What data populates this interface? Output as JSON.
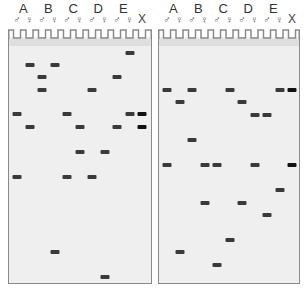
{
  "lanes": [
    {
      "group": "A",
      "sex": "♂"
    },
    {
      "group": "A",
      "sex": "♀"
    },
    {
      "group": "B",
      "sex": "♂"
    },
    {
      "group": "B",
      "sex": "♀"
    },
    {
      "group": "C",
      "sex": "♂"
    },
    {
      "group": "C",
      "sex": "♀"
    },
    {
      "group": "D",
      "sex": "♂"
    },
    {
      "group": "D",
      "sex": "♀"
    },
    {
      "group": "E",
      "sex": "♂"
    },
    {
      "group": "E",
      "sex": "♀"
    },
    {
      "group": "",
      "sex": "X"
    }
  ],
  "group_labels": [
    "A",
    "B",
    "C",
    "D",
    "E"
  ],
  "gels": [
    {
      "name": "left-gel",
      "left": 8,
      "width": 144,
      "lane_start": 17,
      "lane_spacing": 12.5,
      "bands": [
        {
          "y": 53,
          "lanes": [
            9
          ]
        },
        {
          "y": 65,
          "lanes": [
            1,
            3
          ]
        },
        {
          "y": 77,
          "lanes": [
            2,
            8
          ]
        },
        {
          "y": 90,
          "lanes": [
            2,
            6
          ]
        },
        {
          "y": 114,
          "lanes": [
            0,
            4,
            9,
            10
          ]
        },
        {
          "y": 127,
          "lanes": [
            1,
            5,
            8,
            10
          ]
        },
        {
          "y": 152,
          "lanes": [
            5,
            7
          ]
        },
        {
          "y": 177,
          "lanes": [
            0,
            4,
            6
          ]
        },
        {
          "y": 252,
          "lanes": [
            3
          ]
        },
        {
          "y": 277,
          "lanes": [
            7
          ]
        }
      ]
    },
    {
      "name": "right-gel",
      "left": 158,
      "width": 142,
      "lane_start": 167,
      "lane_spacing": 12.5,
      "bands": [
        {
          "y": 90,
          "lanes": [
            0,
            2,
            5,
            9,
            10
          ]
        },
        {
          "y": 102,
          "lanes": [
            1,
            6
          ]
        },
        {
          "y": 115,
          "lanes": [
            7,
            8
          ]
        },
        {
          "y": 140,
          "lanes": [
            2
          ]
        },
        {
          "y": 165,
          "lanes": [
            0,
            3,
            4,
            7,
            10
          ]
        },
        {
          "y": 190,
          "lanes": [
            9
          ]
        },
        {
          "y": 203,
          "lanes": [
            3,
            6
          ]
        },
        {
          "y": 215,
          "lanes": [
            8
          ]
        },
        {
          "y": 240,
          "lanes": [
            5
          ]
        },
        {
          "y": 252,
          "lanes": [
            1
          ]
        },
        {
          "y": 265,
          "lanes": [
            4
          ]
        }
      ]
    }
  ],
  "colors": {
    "band": "#3a3a3a",
    "band_control": "#111111",
    "gel": "#efefef",
    "outline": "#8a8a8a"
  }
}
